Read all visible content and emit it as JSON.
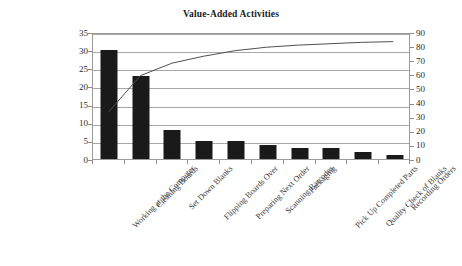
{
  "chart_data": {
    "type": "bar",
    "title": "Value-Added Activities",
    "xlabel": "",
    "ylabel": "",
    "grid": true,
    "legend": "none",
    "categories": [
      "Working at the Computer",
      "Cleaning Boards",
      "Set Down Blanks",
      "Flipping Boards Over",
      "Preparing Next Order",
      "Scanning Barcodes",
      "Packaging",
      "Pick Up Completed Parts",
      "Quality Check of Blanks",
      "Recording Orders"
    ],
    "series": [
      {
        "name": "Frequency",
        "type": "bar",
        "axis": "left",
        "values": [
          30,
          23,
          8,
          5,
          5,
          4,
          3,
          3,
          2,
          1
        ]
      },
      {
        "name": "Cumulative Percentage",
        "type": "line",
        "axis": "right",
        "values": [
          34,
          60,
          69,
          75,
          81,
          85,
          89,
          92,
          94,
          85
        ]
      }
    ],
    "left_axis": {
      "ticks": [
        0,
        5,
        10,
        15,
        20,
        25,
        30,
        35
      ],
      "ylim": [
        0,
        35
      ]
    },
    "right_axis": {
      "ticks": [
        0,
        10,
        20,
        30,
        40,
        50,
        60,
        70,
        80,
        90
      ],
      "ylim": [
        0,
        90
      ]
    },
    "line_points_pct": [
      34,
      60,
      69,
      74,
      78,
      80.5,
      82,
      83,
      84,
      84.5
    ],
    "colors": {
      "bar": "#1a1a1a",
      "line": "#4d4d4d",
      "grid": "#a8a8a8",
      "frame": "#9a9a9a",
      "text": "#2b2b2b",
      "background": "#ffffff"
    }
  }
}
